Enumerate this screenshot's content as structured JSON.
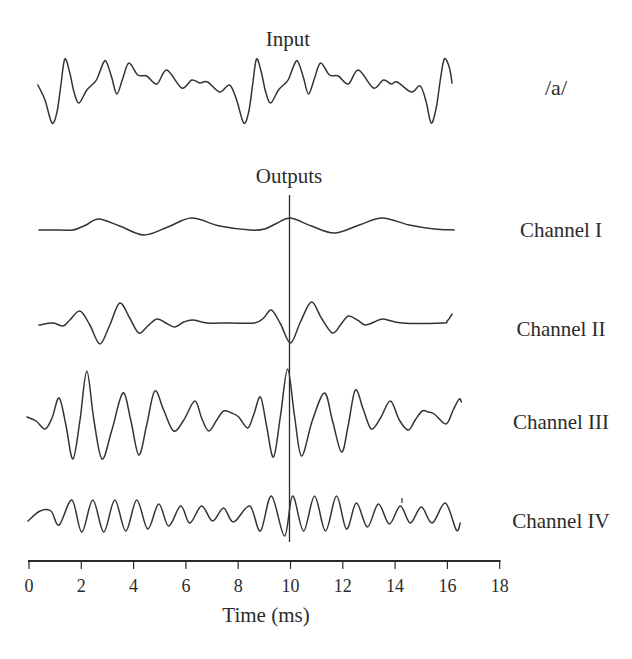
{
  "figure": {
    "input_label": "Input",
    "input_phoneme": "/a/",
    "outputs_label": "Outputs",
    "channel_labels": [
      "Channel I",
      "Channel II",
      "Channel III",
      "Channel IV"
    ],
    "x_axis_label": "Time (ms)"
  },
  "chart_data": {
    "type": "line",
    "title": "",
    "xlabel": "Time (ms)",
    "ylabel": "",
    "xlim": [
      0,
      18
    ],
    "xticks": [
      0,
      2,
      4,
      6,
      8,
      10,
      12,
      14,
      16,
      18
    ],
    "x_tick_labels": [
      "0",
      "2",
      "4",
      "6",
      "8",
      "10",
      "12",
      "14",
      "16",
      "18"
    ],
    "grid": false,
    "legend": "none — each trace labelled at right",
    "amplitude_units": "relative (arbitrary units, positive = up)",
    "annotations": [
      {
        "type": "vertical-line",
        "x": 10,
        "spans": "Outputs traces (Channel I – Channel IV)"
      },
      {
        "type": "text",
        "text": "Input",
        "position": "above input trace"
      },
      {
        "type": "text",
        "text": "/a/",
        "position": "right of input trace"
      },
      {
        "type": "text",
        "text": "Outputs",
        "position": "above vertical line"
      }
    ],
    "series": [
      {
        "name": "Input",
        "label": "/a/",
        "points": [
          [
            0.34,
            0
          ],
          [
            0.61,
            -15
          ],
          [
            0.88,
            -38
          ],
          [
            1.07,
            -27
          ],
          [
            1.22,
            0
          ],
          [
            1.37,
            26
          ],
          [
            1.56,
            12
          ],
          [
            1.72,
            -7
          ],
          [
            1.91,
            -18
          ],
          [
            2.21,
            -5
          ],
          [
            2.52,
            3
          ],
          [
            2.63,
            8
          ],
          [
            2.86,
            23
          ],
          [
            2.98,
            22
          ],
          [
            3.17,
            7
          ],
          [
            3.36,
            -9
          ],
          [
            3.59,
            7
          ],
          [
            3.82,
            22
          ],
          [
            4.16,
            10
          ],
          [
            4.5,
            9
          ],
          [
            4.89,
            1
          ],
          [
            5.27,
            15
          ],
          [
            5.84,
            -3
          ],
          [
            6.22,
            5
          ],
          [
            6.53,
            2
          ],
          [
            6.83,
            3
          ],
          [
            7.29,
            -7
          ],
          [
            7.67,
            0
          ],
          [
            7.94,
            -15
          ],
          [
            8.21,
            -38
          ],
          [
            8.4,
            -27
          ],
          [
            8.55,
            0
          ],
          [
            8.7,
            26
          ],
          [
            8.89,
            12
          ],
          [
            9.05,
            -7
          ],
          [
            9.24,
            -18
          ],
          [
            9.54,
            -5
          ],
          [
            9.85,
            3
          ],
          [
            9.96,
            8
          ],
          [
            10.19,
            23
          ],
          [
            10.31,
            22
          ],
          [
            10.5,
            7
          ],
          [
            10.69,
            -9
          ],
          [
            10.92,
            7
          ],
          [
            11.15,
            22
          ],
          [
            11.49,
            10
          ],
          [
            11.83,
            9
          ],
          [
            12.21,
            1
          ],
          [
            12.6,
            15
          ],
          [
            13.17,
            -3
          ],
          [
            13.55,
            5
          ],
          [
            13.85,
            1
          ],
          [
            14.08,
            3
          ],
          [
            14.62,
            -7
          ],
          [
            14.96,
            -1
          ],
          [
            15.19,
            -17
          ],
          [
            15.38,
            -38
          ],
          [
            15.57,
            -23
          ],
          [
            15.73,
            5
          ],
          [
            15.88,
            26
          ],
          [
            16.07,
            18
          ],
          [
            16.18,
            2
          ]
        ]
      },
      {
        "name": "Channel I",
        "points": [
          [
            0.38,
            0
          ],
          [
            1.18,
            0
          ],
          [
            1.68,
            0
          ],
          [
            2.18,
            5
          ],
          [
            2.67,
            11
          ],
          [
            3.47,
            4
          ],
          [
            4.39,
            -5
          ],
          [
            5.31,
            3
          ],
          [
            6.22,
            12
          ],
          [
            7.29,
            4
          ],
          [
            8.47,
            0
          ],
          [
            9.01,
            1
          ],
          [
            9.5,
            7
          ],
          [
            10.0,
            12
          ],
          [
            10.8,
            4
          ],
          [
            11.68,
            -3
          ],
          [
            12.63,
            5
          ],
          [
            13.51,
            12
          ],
          [
            14.54,
            5
          ],
          [
            15.5,
            1
          ],
          [
            16.26,
            0
          ]
        ]
      },
      {
        "name": "Channel II",
        "points": [
          [
            0.38,
            -2
          ],
          [
            0.92,
            0
          ],
          [
            1.3,
            -3
          ],
          [
            1.56,
            3
          ],
          [
            1.95,
            12
          ],
          [
            2.33,
            -2
          ],
          [
            2.71,
            -21
          ],
          [
            3.09,
            -2
          ],
          [
            3.47,
            20
          ],
          [
            3.85,
            5
          ],
          [
            4.2,
            -10
          ],
          [
            4.54,
            -3
          ],
          [
            4.89,
            4
          ],
          [
            5.23,
            0
          ],
          [
            5.57,
            -4
          ],
          [
            5.92,
            1
          ],
          [
            6.26,
            3
          ],
          [
            6.83,
            0
          ],
          [
            7.67,
            0
          ],
          [
            8.63,
            0
          ],
          [
            8.97,
            5
          ],
          [
            9.27,
            13
          ],
          [
            9.62,
            -1
          ],
          [
            10.0,
            -20
          ],
          [
            10.38,
            1
          ],
          [
            10.8,
            21
          ],
          [
            11.18,
            5
          ],
          [
            11.6,
            -10
          ],
          [
            11.91,
            -2
          ],
          [
            12.21,
            7
          ],
          [
            12.56,
            3
          ],
          [
            12.86,
            -2
          ],
          [
            13.21,
            1
          ],
          [
            13.55,
            4
          ],
          [
            14.27,
            0
          ],
          [
            15.8,
            0
          ],
          [
            15.99,
            2
          ],
          [
            16.18,
            9
          ]
        ]
      },
      {
        "name": "Channel III",
        "points": [
          [
            -0.08,
            0
          ],
          [
            0.27,
            -4
          ],
          [
            0.61,
            -12
          ],
          [
            0.88,
            -1
          ],
          [
            1.15,
            19
          ],
          [
            1.41,
            -8
          ],
          [
            1.68,
            -42
          ],
          [
            1.95,
            -3
          ],
          [
            2.21,
            46
          ],
          [
            2.48,
            -3
          ],
          [
            2.79,
            -42
          ],
          [
            3.17,
            -13
          ],
          [
            3.59,
            24
          ],
          [
            3.89,
            -3
          ],
          [
            4.2,
            -38
          ],
          [
            4.5,
            -8
          ],
          [
            4.81,
            26
          ],
          [
            5.15,
            7
          ],
          [
            5.53,
            -14
          ],
          [
            5.92,
            -3
          ],
          [
            6.34,
            16
          ],
          [
            6.6,
            -1
          ],
          [
            6.87,
            -14
          ],
          [
            7.18,
            -3
          ],
          [
            7.44,
            6
          ],
          [
            7.75,
            4
          ],
          [
            8.02,
            0
          ],
          [
            8.36,
            -11
          ],
          [
            8.59,
            2
          ],
          [
            8.85,
            20
          ],
          [
            9.08,
            -8
          ],
          [
            9.35,
            -40
          ],
          [
            9.62,
            2
          ],
          [
            9.89,
            48
          ],
          [
            10.15,
            2
          ],
          [
            10.42,
            -39
          ],
          [
            10.84,
            -3
          ],
          [
            11.3,
            24
          ],
          [
            11.6,
            -3
          ],
          [
            11.95,
            -35
          ],
          [
            12.21,
            -8
          ],
          [
            12.48,
            27
          ],
          [
            12.79,
            7
          ],
          [
            13.09,
            -12
          ],
          [
            13.44,
            -1
          ],
          [
            13.82,
            16
          ],
          [
            14.16,
            -3
          ],
          [
            14.5,
            -13
          ],
          [
            14.77,
            -3
          ],
          [
            15.04,
            6
          ],
          [
            15.27,
            5
          ],
          [
            15.5,
            3
          ],
          [
            15.95,
            -7
          ],
          [
            16.22,
            7
          ],
          [
            16.45,
            18
          ],
          [
            16.53,
            15
          ]
        ]
      },
      {
        "name": "Channel IV",
        "points": [
          [
            -0.04,
            -5
          ],
          [
            0.42,
            5
          ],
          [
            0.84,
            5
          ],
          [
            1.15,
            -9
          ],
          [
            1.64,
            16
          ],
          [
            2.02,
            -16
          ],
          [
            2.44,
            16
          ],
          [
            2.86,
            -16
          ],
          [
            3.28,
            16
          ],
          [
            3.7,
            -15
          ],
          [
            4.12,
            16
          ],
          [
            4.54,
            -13
          ],
          [
            4.96,
            12
          ],
          [
            5.34,
            -10
          ],
          [
            5.8,
            10
          ],
          [
            6.15,
            -7
          ],
          [
            6.6,
            10
          ],
          [
            7.02,
            -5
          ],
          [
            7.44,
            8
          ],
          [
            7.82,
            -6
          ],
          [
            8.44,
            10
          ],
          [
            8.85,
            -15
          ],
          [
            9.27,
            20
          ],
          [
            9.77,
            -20
          ],
          [
            10.08,
            20
          ],
          [
            10.5,
            -15
          ],
          [
            10.92,
            20
          ],
          [
            11.34,
            -15
          ],
          [
            11.76,
            20
          ],
          [
            12.14,
            -13
          ],
          [
            12.52,
            13
          ],
          [
            12.94,
            -11
          ],
          [
            13.36,
            12
          ],
          [
            13.78,
            -8
          ],
          [
            14.2,
            10
          ],
          [
            14.58,
            -7
          ],
          [
            15.0,
            9
          ],
          [
            15.42,
            -7
          ],
          [
            15.92,
            13
          ],
          [
            16.34,
            -14
          ],
          [
            16.49,
            -7
          ]
        ]
      }
    ]
  }
}
